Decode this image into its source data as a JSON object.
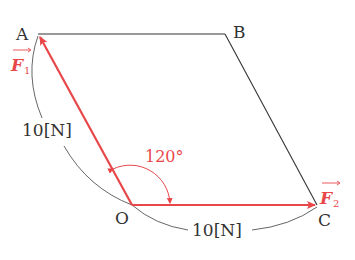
{
  "points": {
    "A": {
      "label": "A",
      "x": 38,
      "y": 34
    },
    "B": {
      "label": "B",
      "x": 225,
      "y": 34
    },
    "O": {
      "label": "O",
      "x": 132,
      "y": 205
    },
    "C": {
      "label": "C",
      "x": 317,
      "y": 205
    }
  },
  "vectors": {
    "F1": {
      "symbol": "F",
      "subscript": "1",
      "from": "O",
      "to": "A"
    },
    "F2": {
      "symbol": "F",
      "subscript": "2",
      "from": "O",
      "to": "C"
    }
  },
  "measurements": {
    "OA_length": "10[N]",
    "OC_length": "10[N]",
    "angle_AOC": "120°"
  },
  "colors": {
    "vector": "#e8474a",
    "line": "#333333",
    "text": "#333333"
  }
}
